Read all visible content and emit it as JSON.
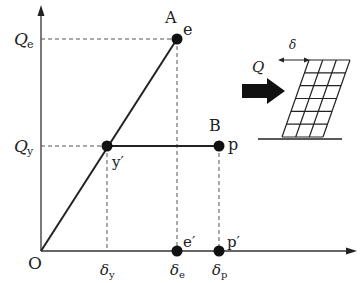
{
  "diagram": {
    "type": "load-displacement (elastic-perfectly-plastic) curve with structure sketch",
    "axes": {
      "origin_label": "O",
      "y_ticks": [
        {
          "main": "Q",
          "sub": "e"
        },
        {
          "main": "Q",
          "sub": "y"
        }
      ],
      "x_ticks": [
        {
          "main": "δ",
          "sub": "y"
        },
        {
          "main": "δ",
          "sub": "e"
        },
        {
          "main": "δ",
          "sub": "p"
        }
      ]
    },
    "points": {
      "A": {
        "upper": "A",
        "side": "e"
      },
      "B": {
        "upper": "B",
        "side": "p"
      },
      "y_prime": {
        "label": "y′"
      },
      "e_prime": {
        "label": "e′"
      },
      "p_prime": {
        "label": "p′"
      }
    },
    "inset": {
      "force_label": "Q",
      "displacement_label": "δ",
      "frame_rows": 6,
      "frame_cols": 3
    },
    "colors": {
      "line": "#222222",
      "dashed": "#555555",
      "dot": "#111111"
    }
  }
}
